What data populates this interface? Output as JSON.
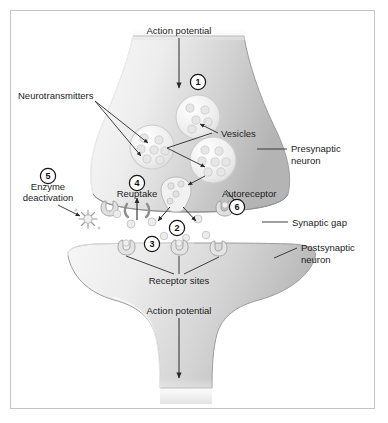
{
  "diagram": {
    "frame": {
      "border_color": "#c4c4c4",
      "background": "#ffffff"
    },
    "palette": {
      "neuron_light": "#f2f2f2",
      "neuron_mid": "#d6d6d6",
      "neuron_dark": "#b9b9b9",
      "outline": "#9a9a9a",
      "vesicle_outline": "#c9c9c9",
      "transmitter_fill": "#e3e3e3",
      "text": "#1d1d1d",
      "leader_line": "#2a2a2a"
    },
    "labels": {
      "action_potential_top": "Action potential",
      "action_potential_bottom": "Action potential",
      "neurotransmitters": "Neurotransmitters",
      "vesicles": "Vesicles",
      "presynaptic_neuron_line1": "Presynaptic",
      "presynaptic_neuron_line2": "neuron",
      "postsynaptic_neuron_line1": "Postsynaptic",
      "postsynaptic_neuron_line2": "neuron",
      "synaptic_gap": "Synaptic gap",
      "receptor_sites": "Receptor sites",
      "reuptake": "Reuptake",
      "autoreceptor": "Autoreceptor",
      "enzyme_line1": "Enzyme",
      "enzyme_line2": "deactivation"
    },
    "steps": [
      {
        "id": "1",
        "marker": "1",
        "caption": "Action potential arrives at terminal"
      },
      {
        "id": "2",
        "marker": "2",
        "caption": "Neurotransmitter release into gap"
      },
      {
        "id": "3",
        "marker": "3",
        "caption": "Binding at receptor sites"
      },
      {
        "id": "4",
        "marker": "4",
        "caption": "Reuptake"
      },
      {
        "id": "5",
        "marker": "5",
        "caption": "Enzyme deactivation"
      },
      {
        "id": "6",
        "marker": "6",
        "caption": "Autoreceptor"
      }
    ],
    "vesicles": [
      {
        "name": "vesicle-upper",
        "cx": 198,
        "cy": 117,
        "r": 22
      },
      {
        "name": "vesicle-middle",
        "cx": 152,
        "cy": 147,
        "r": 22
      },
      {
        "name": "vesicle-lower",
        "cx": 213,
        "cy": 160,
        "r": 23
      },
      {
        "name": "vesicle-fusing",
        "cx": 176,
        "cy": 192,
        "r": 15
      }
    ]
  }
}
